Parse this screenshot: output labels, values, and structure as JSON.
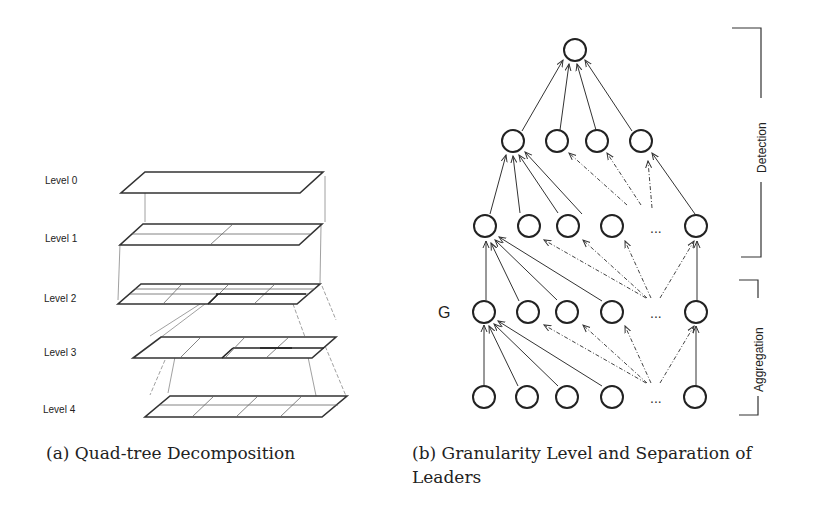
{
  "subfigure_a": {
    "caption": "(a) Quad-tree Decomposition",
    "levels": [
      "Level 0",
      "Level 1",
      "Level 2",
      "Level 3",
      "Level 4"
    ]
  },
  "subfigure_b": {
    "caption": "(b) Granularity Level and Separation of Leaders",
    "node_label": "G",
    "ellipsis": "...",
    "brackets": [
      "Detection",
      "Aggregation"
    ]
  }
}
